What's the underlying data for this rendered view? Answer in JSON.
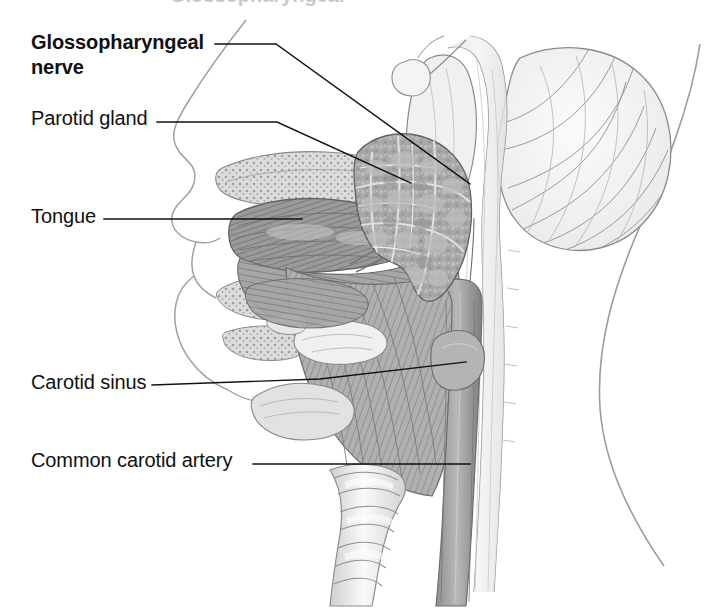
{
  "figure": {
    "view": "mid-sagittal",
    "style": "grayscale pencil medical illustration",
    "background_color": "#ffffff",
    "ink_color": "#111111",
    "partial_text_top": "Glossopharyngeal"
  },
  "labels": [
    {
      "id": "glossopharyngeal-nerve",
      "text": "Glossopharyngeal\nnerve",
      "bold": true,
      "x": 31,
      "y": 30,
      "leader": "M 215 44 L 276 44 L 470 184"
    },
    {
      "id": "parotid-gland",
      "text": "Parotid gland",
      "bold": false,
      "x": 31,
      "y": 106,
      "leader": "M 157 122 L 277 122 L 411 183"
    },
    {
      "id": "tongue",
      "text": "Tongue",
      "bold": false,
      "x": 31,
      "y": 204,
      "leader": "M 104 219 L 302 219"
    },
    {
      "id": "carotid-sinus",
      "text": "Carotid sinus",
      "bold": false,
      "x": 31,
      "y": 370,
      "leader": "M 152 385 L 320 379 L 466 362"
    },
    {
      "id": "common-carotid-artery",
      "text": "Common carotid artery",
      "bold": false,
      "x": 31,
      "y": 448,
      "leader": "M 253 464 L 470 464"
    }
  ],
  "structures": [
    {
      "id": "cerebellum",
      "name": "cerebellum",
      "tone": "#f2f2f2"
    },
    {
      "id": "brainstem",
      "name": "brainstem",
      "tone": "#ededed"
    },
    {
      "id": "parotid-gland-shape",
      "name": "parotid gland",
      "tone": "#a9a9a9"
    },
    {
      "id": "tongue-shape",
      "name": "tongue",
      "tone": "#8e8e8e"
    },
    {
      "id": "hard-palate",
      "name": "hard palate",
      "tone": "#d8d8d8"
    },
    {
      "id": "trachea",
      "name": "trachea",
      "tone": "#e6e6e6"
    },
    {
      "id": "carotid-artery-shape",
      "name": "common carotid artery",
      "tone": "#9a9a9a"
    },
    {
      "id": "face-profile",
      "name": "facial profile",
      "tone": "#bdbdbd"
    },
    {
      "id": "neck-contour",
      "name": "posterior neck contour",
      "tone": "#bdbdbd"
    },
    {
      "id": "pharynx",
      "name": "pharynx",
      "tone": "#9f9f9f"
    },
    {
      "id": "larynx",
      "name": "larynx",
      "tone": "#c4c4c4"
    },
    {
      "id": "vertebrae",
      "name": "cervical vertebrae",
      "tone": "#cfcfcf"
    }
  ]
}
